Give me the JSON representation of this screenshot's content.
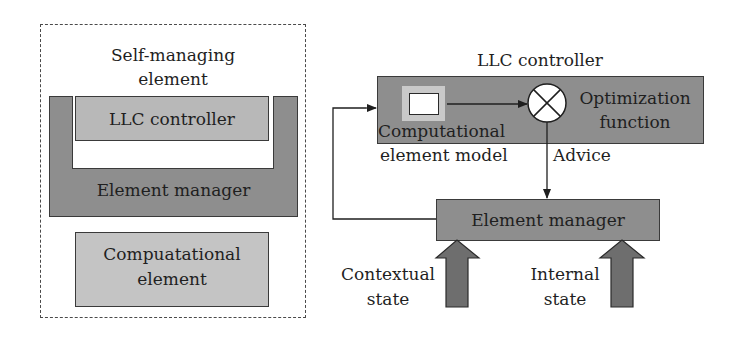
{
  "left_diagram": {
    "title_line1": "Self-managing",
    "title_line2": "element",
    "llc_label": "LLC controller",
    "element_manager_label": "Element manager",
    "computational_line1": "Compuatational",
    "computational_line2": "element"
  },
  "right_diagram": {
    "llc_title": "LLC controller",
    "model_line1": "Computational",
    "model_line2": "element model",
    "optimization_line1": "Optimization",
    "optimization_line2": "function",
    "advice_label": "Advice",
    "element_manager_label": "Element manager",
    "contextual_line1": "Contextual",
    "contextual_line2": "state",
    "internal_line1": "Internal",
    "internal_line2": "state"
  },
  "colors": {
    "element_manager_fill": "#8e8e8e",
    "llc_fill": "#b8b8b8",
    "computational_fill": "#c4c4c4",
    "state_arrow_fill": "#6e6e6e",
    "stroke": "#3a3a3a"
  }
}
